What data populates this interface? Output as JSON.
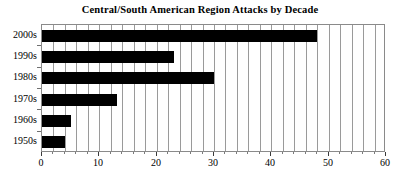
{
  "chart_data": {
    "type": "bar",
    "orientation": "horizontal",
    "title": "Central/South American Region Attacks by Decade",
    "xlabel": "",
    "ylabel": "",
    "categories": [
      "2000s",
      "1990s",
      "1980s",
      "1970s",
      "1960s",
      "1950s"
    ],
    "values": [
      48,
      23,
      30,
      13,
      5,
      4
    ],
    "series": [
      {
        "name": "Attacks",
        "values": [
          48,
          23,
          30,
          13,
          5,
          4
        ],
        "color": "#000000"
      }
    ],
    "xlim": [
      0,
      60
    ],
    "xticks": [
      0,
      10,
      20,
      30,
      40,
      50,
      60
    ],
    "xticklabels": [
      "0",
      "10",
      "20",
      "30",
      "40",
      "50",
      "60"
    ],
    "x_minor_tick_step": 2,
    "gridlines": {
      "vertical": true,
      "horizontal": false,
      "step": 2,
      "color": "#9a9a9a"
    },
    "legend": null,
    "plot_background": "#ffffff",
    "frame_color": "#8a8a8a"
  }
}
